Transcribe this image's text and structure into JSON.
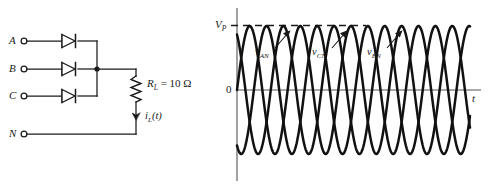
{
  "figure": {
    "kind": "three-phase half-wave rectifier circuit and phase voltage waveforms",
    "background_color": "#ffffff",
    "line_color": "#1a1a1a"
  },
  "circuit": {
    "terminals": [
      {
        "name": "terminal-a",
        "label": "A"
      },
      {
        "name": "terminal-b",
        "label": "B"
      },
      {
        "name": "terminal-c",
        "label": "C"
      },
      {
        "name": "terminal-n",
        "label": "N"
      }
    ],
    "diodes": [
      {
        "name": "diode-a"
      },
      {
        "name": "diode-b"
      },
      {
        "name": "diode-c"
      }
    ],
    "resistor": {
      "symbol": "R",
      "subscript": "L",
      "equals": "=",
      "value": "10",
      "unit": "Ω",
      "full_label": "R_L = 10 Ω"
    },
    "current": {
      "symbol": "i",
      "subscript": "L",
      "argument": "(t)",
      "full_label": "i_L(t)"
    }
  },
  "plot": {
    "y_axis_label": "V",
    "y_axis_label_subscript": "P",
    "origin_label": "0",
    "x_axis_label": "t",
    "peak_dashed_line": true,
    "waveforms": [
      {
        "name": "wave-van",
        "symbol": "v",
        "subscript": "AN"
      },
      {
        "name": "wave-vcn",
        "symbol": "v",
        "subscript": "CN"
      },
      {
        "name": "wave-vbn",
        "symbol": "v",
        "subscript": "BN"
      }
    ]
  },
  "chart_data": {
    "type": "line",
    "title": "",
    "xlabel": "t",
    "ylabel": "V_P",
    "grid": false,
    "legend": "inline-annotations",
    "xlim": [
      0,
      4.6
    ],
    "ylim": [
      -1.15,
      1.15
    ],
    "y_ticks": [
      {
        "value": 0,
        "label": "0"
      },
      {
        "value": 1,
        "label": "V_P"
      }
    ],
    "amplitude": 1,
    "period_units": "cycles",
    "series": [
      {
        "name": "v_AN",
        "phase_deg": 0,
        "annotation": "v_AN",
        "annotation_x": 0.66
      },
      {
        "name": "v_BN",
        "phase_deg": -240,
        "annotation": "v_BN",
        "annotation_x": 2.0
      },
      {
        "name": "v_CN",
        "phase_deg": -120,
        "annotation": "v_CN",
        "annotation_x": 1.33
      }
    ],
    "annotations": [
      {
        "text": "V_P",
        "type": "peak-reference-dashed-line",
        "y": 1
      },
      {
        "text": "0",
        "type": "origin"
      },
      {
        "text": "t",
        "type": "axis-end"
      }
    ]
  }
}
